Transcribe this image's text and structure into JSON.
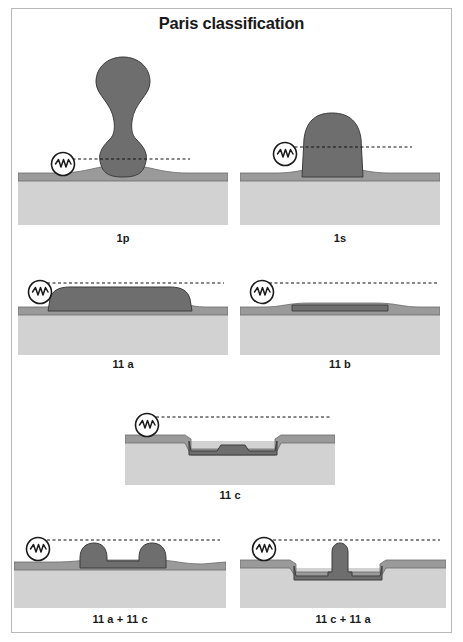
{
  "figure": {
    "title": "Paris classification",
    "colors": {
      "submucosa": "#d2d2d2",
      "mucosa_band": "#9a9a9a",
      "lesion": "#6e6e6e",
      "outline": "#3c3c3c",
      "reference_line": "#111111",
      "frame": "#b9b9b9",
      "text": "#1a1a1a",
      "background": "#ffffff"
    },
    "scale_icon": {
      "name": "closed-biopsy-forceps-icon",
      "description": "circle containing zigzag wave line"
    },
    "reference_line_style": "dashed"
  },
  "panels": [
    {
      "id": "1p",
      "caption": "1p",
      "type": "pedunculated",
      "description": "Pedunculated polyp with bulbous head on narrow stalk"
    },
    {
      "id": "1s",
      "caption": "1s",
      "type": "sessile",
      "description": "Sessile polyp, broad based dome"
    },
    {
      "id": "11a",
      "caption": "11 a",
      "type": "flat-elevated",
      "description": "Slightly elevated flat lesion"
    },
    {
      "id": "11b",
      "caption": "11 b",
      "type": "flat",
      "description": "Completely flat lesion level with mucosa"
    },
    {
      "id": "11c",
      "caption": "11 c",
      "type": "depressed",
      "description": "Slightly depressed lesion"
    },
    {
      "id": "11a+11c",
      "caption": "11 a + 11 c",
      "type": "elevated-with-depression",
      "description": "Elevated lesion with central depression"
    },
    {
      "id": "11c+11a",
      "caption": "11 c + 11 a",
      "type": "depressed-with-elevation",
      "description": "Depressed lesion with central elevation"
    }
  ]
}
